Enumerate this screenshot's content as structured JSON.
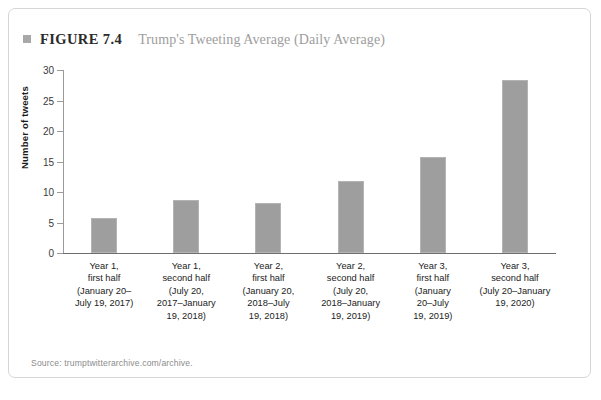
{
  "figure": {
    "bullet_icon": "square-bullet-icon",
    "number_label": "FIGURE 7.4",
    "caption": "Trump's Tweeting Average (Daily Average)",
    "source": "Source: trumptwitterarchive.com/archive."
  },
  "colors": {
    "bar_fill": "#9e9e9e",
    "bar_border": "#b4b4b4",
    "frame_border": "#d6d6d6",
    "caption_gray": "#9d9d9d",
    "axis_gray": "#9b9b9b"
  },
  "chart_data": {
    "type": "bar",
    "title": "Trump's Tweeting Average (Daily Average)",
    "xlabel": "",
    "ylabel": "Number of tweets",
    "ylim": [
      0,
      30
    ],
    "yticks": [
      0,
      5,
      10,
      15,
      20,
      25,
      30
    ],
    "ytick_labels": [
      "0",
      "5",
      "10",
      "15",
      "20",
      "25",
      "30"
    ],
    "grid": false,
    "legend": "none",
    "categories": [
      "Year 1,\nfirst half\n(January 20–\nJuly 19, 2017)",
      "Year 1,\nsecond half\n(July 20,\n2017–January\n19, 2018)",
      "Year 2,\nfirst half\n(January 20,\n2018–July\n19, 2018)",
      "Year 2,\nsecond half\n(July 20,\n2018–January\n19, 2019)",
      "Year 3,\nfirst half\n(January\n20–July\n19, 2019)",
      "Year 3,\nsecond half\n(July 20–January\n19, 2020)"
    ],
    "category_lines": [
      [
        "Year 1,",
        "first half",
        "(January 20–",
        "July 19, 2017)"
      ],
      [
        "Year 1,",
        "second half",
        "(July 20,",
        "2017–January",
        "19, 2018)"
      ],
      [
        "Year 2,",
        "first half",
        "(January 20,",
        "2018–July",
        "19, 2018)"
      ],
      [
        "Year 2,",
        "second half",
        "(July 20,",
        "2018–January",
        "19, 2019)"
      ],
      [
        "Year 3,",
        "first half",
        "(January",
        "20–July",
        "19, 2019)"
      ],
      [
        "Year 3,",
        "second half",
        "(July 20–January",
        "19, 2020)"
      ]
    ],
    "values": [
      5.7,
      8.7,
      8.2,
      11.8,
      15.8,
      28.3
    ]
  }
}
